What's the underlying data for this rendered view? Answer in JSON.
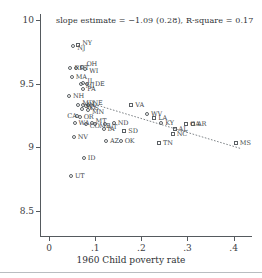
{
  "chart_data": {
    "type": "scatter",
    "title": "",
    "annotation": "slope estimate = −1.09 (0.28), R-square = 0.17",
    "xlabel": "1960 Child poverty rate",
    "ylabel": "",
    "xlim": [
      -0.02,
      0.44
    ],
    "ylim": [
      8.3,
      10.05
    ],
    "xticks": [
      0,
      0.1,
      0.2,
      0.3,
      0.4
    ],
    "xticklabels": [
      "0",
      ".1",
      ".2",
      ".3",
      ".4"
    ],
    "yticks": [
      8.5,
      9,
      9.5,
      10
    ],
    "yticklabels": [
      "8.5",
      "9",
      "9.5",
      "10"
    ],
    "grid": false,
    "legend": "none",
    "slope": -1.09,
    "slope_se": 0.28,
    "r_square": 0.17,
    "marker_shapes": {
      "circle": "non-south",
      "square": "south"
    },
    "fit_line": {
      "style": "dotted",
      "x_start": 0.105,
      "y_start": 9.33,
      "x_end": 0.415,
      "y_end": 8.99
    },
    "points": [
      {
        "label": "NJ",
        "x": 0.052,
        "y": 9.795,
        "shape": "circle",
        "label_dx": 4,
        "label_dy": 2
      },
      {
        "label": "NY",
        "x": 0.063,
        "y": 9.805,
        "shape": "square",
        "label_dx": 4,
        "label_dy": -2
      },
      {
        "label": "CT",
        "x": 0.058,
        "y": 9.625,
        "shape": "circle",
        "label_dx": 4,
        "label_dy": 0
      },
      {
        "label": "OH",
        "x": 0.072,
        "y": 9.635,
        "shape": "circle",
        "label_dx": 4,
        "label_dy": -3
      },
      {
        "label": "WI",
        "x": 0.078,
        "y": 9.615,
        "shape": "circle",
        "label_dx": 4,
        "label_dy": 2
      },
      {
        "label": "RI",
        "x": 0.046,
        "y": 9.625,
        "shape": "circle",
        "label_dx": 4,
        "label_dy": 0
      },
      {
        "label": "MA",
        "x": 0.049,
        "y": 9.555,
        "shape": "circle",
        "label_dx": 4,
        "label_dy": 0
      },
      {
        "label": "IL",
        "x": 0.074,
        "y": 9.505,
        "shape": "circle",
        "label_dx": 4,
        "label_dy": -2
      },
      {
        "label": "MI",
        "x": 0.07,
        "y": 9.495,
        "shape": "circle",
        "label_dx": 4,
        "label_dy": 2
      },
      {
        "label": "DE",
        "x": 0.082,
        "y": 9.5,
        "shape": "circle",
        "label_dx": 8,
        "label_dy": 0
      },
      {
        "label": "PA",
        "x": 0.074,
        "y": 9.455,
        "shape": "circle",
        "label_dx": 4,
        "label_dy": 0
      },
      {
        "label": "NH",
        "x": 0.043,
        "y": 9.4,
        "shape": "circle",
        "label_dx": 4,
        "label_dy": 0
      },
      {
        "label": "MD",
        "x": 0.063,
        "y": 9.335,
        "shape": "circle",
        "label_dx": 4,
        "label_dy": -2
      },
      {
        "label": "IN",
        "x": 0.073,
        "y": 9.33,
        "shape": "circle",
        "label_dx": 4,
        "label_dy": 0
      },
      {
        "label": "NE",
        "x": 0.085,
        "y": 9.335,
        "shape": "circle",
        "label_dx": 4,
        "label_dy": -2
      },
      {
        "label": "KS",
        "x": 0.079,
        "y": 9.325,
        "shape": "circle",
        "label_dx": 4,
        "label_dy": 2
      },
      {
        "label": "MN",
        "x": 0.084,
        "y": 9.295,
        "shape": "circle",
        "label_dx": 4,
        "label_dy": 2
      },
      {
        "label": "WY",
        "x": 0.071,
        "y": 9.3,
        "shape": "circle",
        "label_dx": 4,
        "label_dy": -2
      },
      {
        "label": "OR",
        "x": 0.066,
        "y": 9.24,
        "shape": "circle",
        "label_dx": 4,
        "label_dy": 0
      },
      {
        "label": "CA",
        "x": 0.061,
        "y": 9.245,
        "shape": "circle",
        "label_dx": -10,
        "label_dy": 0
      },
      {
        "label": "WA",
        "x": 0.055,
        "y": 9.19,
        "shape": "circle",
        "label_dx": 4,
        "label_dy": 0
      },
      {
        "label": "CO",
        "x": 0.079,
        "y": 9.185,
        "shape": "circle",
        "label_dx": 4,
        "label_dy": 2
      },
      {
        "label": "MT",
        "x": 0.092,
        "y": 9.19,
        "shape": "circle",
        "label_dx": 4,
        "label_dy": -2
      },
      {
        "label": "ME",
        "x": 0.1,
        "y": 9.185,
        "shape": "circle",
        "label_dx": 4,
        "label_dy": 2
      },
      {
        "label": "ND",
        "x": 0.14,
        "y": 9.19,
        "shape": "circle",
        "label_dx": 4,
        "label_dy": 0
      },
      {
        "label": "VT",
        "x": 0.12,
        "y": 9.18,
        "shape": "circle",
        "label_dx": 4,
        "label_dy": 3
      },
      {
        "label": "IA",
        "x": 0.118,
        "y": 9.14,
        "shape": "circle",
        "label_dx": 4,
        "label_dy": 0
      },
      {
        "label": "SD",
        "x": 0.163,
        "y": 9.13,
        "shape": "square",
        "label_dx": 4,
        "label_dy": 0
      },
      {
        "label": "NV",
        "x": 0.053,
        "y": 9.08,
        "shape": "circle",
        "label_dx": 4,
        "label_dy": 0
      },
      {
        "label": "AZ",
        "x": 0.123,
        "y": 9.045,
        "shape": "circle",
        "label_dx": 4,
        "label_dy": 0
      },
      {
        "label": "OK",
        "x": 0.155,
        "y": 9.045,
        "shape": "circle",
        "label_dx": 4,
        "label_dy": 0
      },
      {
        "label": "ID",
        "x": 0.075,
        "y": 8.915,
        "shape": "circle",
        "label_dx": 4,
        "label_dy": 0
      },
      {
        "label": "UT",
        "x": 0.047,
        "y": 8.77,
        "shape": "circle",
        "label_dx": 4,
        "label_dy": 0
      },
      {
        "label": "VA",
        "x": 0.178,
        "y": 9.33,
        "shape": "square",
        "label_dx": 4,
        "label_dy": 0
      },
      {
        "label": "WV",
        "x": 0.212,
        "y": 9.265,
        "shape": "circle",
        "label_dx": 4,
        "label_dy": 0
      },
      {
        "label": "LA",
        "x": 0.228,
        "y": 9.23,
        "shape": "square",
        "label_dx": 4,
        "label_dy": 0
      },
      {
        "label": "KY",
        "x": 0.243,
        "y": 9.19,
        "shape": "circle",
        "label_dx": 4,
        "label_dy": 0
      },
      {
        "label": "GA",
        "x": 0.297,
        "y": 9.185,
        "shape": "square",
        "label_dx": 4,
        "label_dy": 0
      },
      {
        "label": "AR",
        "x": 0.312,
        "y": 9.185,
        "shape": "square",
        "label_dx": 4,
        "label_dy": 0
      },
      {
        "label": "AL",
        "x": 0.272,
        "y": 9.14,
        "shape": "square",
        "label_dx": 4,
        "label_dy": 0
      },
      {
        "label": "NC",
        "x": 0.268,
        "y": 9.105,
        "shape": "square",
        "label_dx": 4,
        "label_dy": 0
      },
      {
        "label": "TN",
        "x": 0.238,
        "y": 9.035,
        "shape": "square",
        "label_dx": 4,
        "label_dy": 0
      },
      {
        "label": "MS",
        "x": 0.405,
        "y": 9.03,
        "shape": "square",
        "label_dx": 4,
        "label_dy": 0
      }
    ]
  }
}
